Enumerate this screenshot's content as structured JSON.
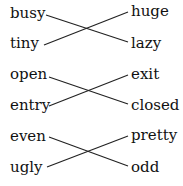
{
  "groups": [
    {
      "left": [
        "busy",
        "tiny"
      ],
      "right": [
        "huge",
        "lazy"
      ],
      "connections": [
        [
          0,
          1
        ],
        [
          1,
          0
        ]
      ]
    },
    {
      "left": [
        "open",
        "entry"
      ],
      "right": [
        "exit",
        "closed"
      ],
      "connections": [
        [
          0,
          1
        ],
        [
          1,
          0
        ]
      ]
    },
    {
      "left": [
        "even",
        "ugly"
      ],
      "right": [
        "pretty",
        "odd"
      ],
      "connections": [
        [
          0,
          1
        ],
        [
          1,
          0
        ]
      ]
    }
  ],
  "words": {
    "g0l0": "busy",
    "g0l1": "tiny",
    "g0r0": "huge",
    "g0r1": "lazy",
    "g1l0": "open",
    "g1l1": "entry",
    "g1r0": "exit",
    "g1r1": "closed",
    "g2l0": "even",
    "g2l1": "ugly",
    "g2r0": "pretty",
    "g2r1": "odd"
  }
}
